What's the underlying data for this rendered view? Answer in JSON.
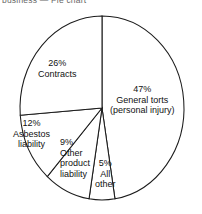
{
  "caption": "business — Pie chart",
  "chart_data": {
    "type": "pie",
    "title": "business — Pie chart",
    "xlabel": "",
    "ylabel": "",
    "grid": false,
    "legend": "none",
    "labels_position": "inside-and-around-slices",
    "start_angle_deg": 0,
    "direction": "clockwise",
    "units": "percent",
    "categories": [
      "General torts (personal injury)",
      "All other",
      "Other product liability",
      "Asbestos liability",
      "Contracts"
    ],
    "values": [
      47,
      5,
      9,
      12,
      26
    ],
    "slices": [
      {
        "id": "general-torts",
        "percent_text": "47%",
        "value": 47,
        "name_line1": "General torts",
        "name_line2": "(personal injury)",
        "fill": "#ffffff",
        "stroke": "#1c1c1c"
      },
      {
        "id": "all-other",
        "percent_text": "5%",
        "value": 5,
        "name_line1": "All",
        "name_line2": "other",
        "fill": "#ffffff",
        "stroke": "#1c1c1c"
      },
      {
        "id": "other-product-liability",
        "percent_text": "9%",
        "value": 9,
        "name_line1": "Other",
        "name_line2": "product",
        "name_line3": "liability",
        "fill": "#ffffff",
        "stroke": "#1c1c1c"
      },
      {
        "id": "asbestos-liability",
        "percent_text": "12%",
        "value": 12,
        "name_line1": "Asbestos",
        "name_line2": "liability",
        "fill": "#ffffff",
        "stroke": "#1c1c1c"
      },
      {
        "id": "contracts",
        "percent_text": "26%",
        "value": 26,
        "name_line1": "Contracts",
        "fill": "#ffffff",
        "stroke": "#1c1c1c"
      }
    ]
  }
}
